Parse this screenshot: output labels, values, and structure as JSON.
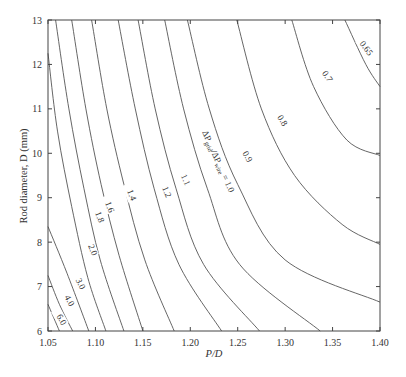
{
  "chart_data": {
    "type": "contour",
    "title": "",
    "xlabel": "P/D",
    "ylabel": "Rod diameter, D (mm)",
    "xlim": [
      1.05,
      1.4
    ],
    "ylim": [
      6,
      13
    ],
    "x_ticks": [
      "1.05",
      "1.10",
      "1.15",
      "1.20",
      "1.25",
      "1.30",
      "1.35",
      "1.40"
    ],
    "y_ticks": [
      "6",
      "7",
      "8",
      "9",
      "10",
      "11",
      "12",
      "13"
    ],
    "grid": false,
    "contour_variable": "ΔPgrid/ΔPwire",
    "main_label": "ΔPgrid/ΔPwire = 1.0",
    "levels": [
      {
        "value": "6.0",
        "label": "6.0",
        "points": [
          [
            1.05,
            6.6
          ],
          [
            1.062,
            6.0
          ]
        ]
      },
      {
        "value": "4.0",
        "label": "4.0",
        "points": [
          [
            1.05,
            7.25
          ],
          [
            1.062,
            6.6
          ],
          [
            1.076,
            6.0
          ]
        ]
      },
      {
        "value": "3.0",
        "label": "3.0",
        "points": [
          [
            1.05,
            8.35
          ],
          [
            1.07,
            7.3
          ],
          [
            1.093,
            6.0
          ]
        ]
      },
      {
        "value": "2.0",
        "label": "2.0",
        "points": [
          [
            1.05,
            12.25
          ],
          [
            1.06,
            10.5
          ],
          [
            1.075,
            8.8
          ],
          [
            1.092,
            7.2
          ],
          [
            1.111,
            6.0
          ]
        ]
      },
      {
        "value": "1.8",
        "label": "1.8",
        "points": [
          [
            1.058,
            13.0
          ],
          [
            1.072,
            11.0
          ],
          [
            1.088,
            9.2
          ],
          [
            1.105,
            7.6
          ],
          [
            1.13,
            6.0
          ]
        ]
      },
      {
        "value": "1.6",
        "label": "1.6",
        "points": [
          [
            1.075,
            13.0
          ],
          [
            1.09,
            11.0
          ],
          [
            1.106,
            9.3
          ],
          [
            1.125,
            7.7
          ],
          [
            1.15,
            6.0
          ]
        ]
      },
      {
        "value": "1.4",
        "label": "1.4",
        "points": [
          [
            1.096,
            13.0
          ],
          [
            1.112,
            11.0
          ],
          [
            1.13,
            9.3
          ],
          [
            1.152,
            7.6
          ],
          [
            1.183,
            6.0
          ]
        ]
      },
      {
        "value": "1.2",
        "label": "1.2",
        "points": [
          [
            1.124,
            13.0
          ],
          [
            1.142,
            11.0
          ],
          [
            1.162,
            9.2
          ],
          [
            1.188,
            7.5
          ],
          [
            1.233,
            6.0
          ]
        ]
      },
      {
        "value": "1.1",
        "label": "1.1",
        "points": [
          [
            1.145,
            13.0
          ],
          [
            1.163,
            11.0
          ],
          [
            1.185,
            9.2
          ],
          [
            1.214,
            7.5
          ],
          [
            1.273,
            6.0
          ]
        ]
      },
      {
        "value": "1.0",
        "label": "ΔPgrid/ΔPwire = 1.0",
        "points": [
          [
            1.173,
            13.0
          ],
          [
            1.193,
            11.0
          ],
          [
            1.218,
            9.2
          ],
          [
            1.252,
            7.5
          ],
          [
            1.337,
            6.0
          ]
        ]
      },
      {
        "value": "0.9",
        "label": "0.9",
        "points": [
          [
            1.197,
            13.0
          ],
          [
            1.22,
            11.0
          ],
          [
            1.25,
            9.3
          ],
          [
            1.3,
            7.6
          ],
          [
            1.4,
            6.65
          ]
        ]
      },
      {
        "value": "0.8",
        "label": "0.8",
        "points": [
          [
            1.249,
            13.0
          ],
          [
            1.275,
            11.0
          ],
          [
            1.31,
            9.5
          ],
          [
            1.36,
            8.4
          ],
          [
            1.4,
            7.95
          ]
        ]
      },
      {
        "value": "0.7",
        "label": "0.7",
        "points": [
          [
            1.307,
            13.0
          ],
          [
            1.33,
            11.5
          ],
          [
            1.365,
            10.3
          ],
          [
            1.4,
            9.95
          ]
        ]
      },
      {
        "value": "0.65",
        "label": "0.65",
        "points": [
          [
            1.363,
            13.0
          ],
          [
            1.385,
            12.0
          ],
          [
            1.4,
            11.5
          ]
        ]
      }
    ]
  }
}
